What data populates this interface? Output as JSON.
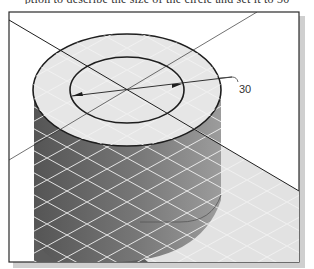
{
  "caption": {
    "text": "ption to describe the size of the circle and set it to 30"
  },
  "figure": {
    "dimension_label": "30",
    "colors": {
      "frame_border": "#2a2a2a",
      "frame_shadow": "#c8c8c8",
      "top_face": "#e6e6e6",
      "side_dark": "#5a5a5a",
      "side_light": "#9a9a9a",
      "floor": "#e2e2e2",
      "grid": "#f5f5f5",
      "edges": "#1e1e1e"
    }
  }
}
